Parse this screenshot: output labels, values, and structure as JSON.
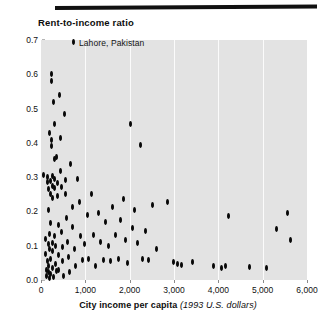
{
  "chart_data": {
    "type": "scatter",
    "title": "Rent-to-income ratio",
    "xlabel_bold": "City income per capita",
    "xlabel_italic": "(1993 U.S. dollars)",
    "ylabel": "Rent-to-income ratio",
    "xlim": [
      0,
      6000
    ],
    "ylim": [
      0.0,
      0.7
    ],
    "x_ticks": [
      0,
      1000,
      2000,
      3000,
      4000,
      5000,
      6000
    ],
    "x_tick_labels": [
      "0",
      "1,000",
      "2,000",
      "3,000",
      "4,000",
      "5,000",
      "6,000"
    ],
    "y_ticks": [
      0.0,
      0.1,
      0.2,
      0.3,
      0.4,
      0.5,
      0.6,
      0.7
    ],
    "y_tick_labels": [
      "0.0",
      "0.1",
      "0.2",
      "0.3",
      "0.4",
      "0.5",
      "0.6",
      "0.7"
    ],
    "grid": "vertical",
    "legend": "none",
    "plot_background": "#e3e3e3",
    "marker_color": "#080808",
    "annotations": [
      {
        "text": "Lahore, Pakistan",
        "x": 360,
        "y": 0.695,
        "marker": true
      }
    ],
    "points": [
      {
        "x": 60,
        "y": 0.305
      },
      {
        "x": 95,
        "y": 0.12
      },
      {
        "x": 110,
        "y": 0.075
      },
      {
        "x": 120,
        "y": 0.03
      },
      {
        "x": 130,
        "y": 0.012
      },
      {
        "x": 145,
        "y": 0.055
      },
      {
        "x": 150,
        "y": 0.3
      },
      {
        "x": 155,
        "y": 0.285
      },
      {
        "x": 160,
        "y": 0.205
      },
      {
        "x": 165,
        "y": 0.105
      },
      {
        "x": 170,
        "y": 0.022
      },
      {
        "x": 175,
        "y": 0.04
      },
      {
        "x": 180,
        "y": 0.265
      },
      {
        "x": 185,
        "y": 0.135
      },
      {
        "x": 190,
        "y": 0.09
      },
      {
        "x": 195,
        "y": 0.005
      },
      {
        "x": 200,
        "y": 0.43
      },
      {
        "x": 205,
        "y": 0.29
      },
      {
        "x": 210,
        "y": 0.25
      },
      {
        "x": 215,
        "y": 0.165
      },
      {
        "x": 220,
        "y": 0.06
      },
      {
        "x": 225,
        "y": 0.018
      },
      {
        "x": 230,
        "y": 0.6
      },
      {
        "x": 235,
        "y": 0.58
      },
      {
        "x": 240,
        "y": 0.408
      },
      {
        "x": 245,
        "y": 0.39
      },
      {
        "x": 250,
        "y": 0.302
      },
      {
        "x": 255,
        "y": 0.275
      },
      {
        "x": 258,
        "y": 0.24
      },
      {
        "x": 262,
        "y": 0.108
      },
      {
        "x": 266,
        "y": 0.085
      },
      {
        "x": 270,
        "y": 0.035
      },
      {
        "x": 275,
        "y": 0.01
      },
      {
        "x": 290,
        "y": 0.52
      },
      {
        "x": 295,
        "y": 0.455
      },
      {
        "x": 300,
        "y": 0.352
      },
      {
        "x": 305,
        "y": 0.296
      },
      {
        "x": 310,
        "y": 0.268
      },
      {
        "x": 315,
        "y": 0.128
      },
      {
        "x": 320,
        "y": 0.098
      },
      {
        "x": 330,
        "y": 0.048
      },
      {
        "x": 340,
        "y": 0.026
      },
      {
        "x": 355,
        "y": 0.358
      },
      {
        "x": 365,
        "y": 0.282
      },
      {
        "x": 375,
        "y": 0.245
      },
      {
        "x": 385,
        "y": 0.16
      },
      {
        "x": 395,
        "y": 0.072
      },
      {
        "x": 405,
        "y": 0.03
      },
      {
        "x": 420,
        "y": 0.54
      },
      {
        "x": 430,
        "y": 0.415
      },
      {
        "x": 445,
        "y": 0.318
      },
      {
        "x": 455,
        "y": 0.272
      },
      {
        "x": 470,
        "y": 0.14
      },
      {
        "x": 480,
        "y": 0.095
      },
      {
        "x": 495,
        "y": 0.055
      },
      {
        "x": 510,
        "y": 0.012
      },
      {
        "x": 530,
        "y": 0.485
      },
      {
        "x": 545,
        "y": 0.292
      },
      {
        "x": 560,
        "y": 0.252
      },
      {
        "x": 580,
        "y": 0.18
      },
      {
        "x": 600,
        "y": 0.112
      },
      {
        "x": 620,
        "y": 0.068
      },
      {
        "x": 640,
        "y": 0.022
      },
      {
        "x": 670,
        "y": 0.338
      },
      {
        "x": 700,
        "y": 0.212
      },
      {
        "x": 720,
        "y": 0.155
      },
      {
        "x": 745,
        "y": 0.09
      },
      {
        "x": 780,
        "y": 0.04
      },
      {
        "x": 820,
        "y": 0.295
      },
      {
        "x": 860,
        "y": 0.228
      },
      {
        "x": 900,
        "y": 0.128
      },
      {
        "x": 940,
        "y": 0.058
      },
      {
        "x": 990,
        "y": 0.105
      },
      {
        "x": 1040,
        "y": 0.19
      },
      {
        "x": 1080,
        "y": 0.062
      },
      {
        "x": 1130,
        "y": 0.25
      },
      {
        "x": 1180,
        "y": 0.132
      },
      {
        "x": 1230,
        "y": 0.042
      },
      {
        "x": 1290,
        "y": 0.196
      },
      {
        "x": 1340,
        "y": 0.112
      },
      {
        "x": 1400,
        "y": 0.058
      },
      {
        "x": 1460,
        "y": 0.168
      },
      {
        "x": 1520,
        "y": 0.098
      },
      {
        "x": 1570,
        "y": 0.055
      },
      {
        "x": 1620,
        "y": 0.212
      },
      {
        "x": 1680,
        "y": 0.13
      },
      {
        "x": 1740,
        "y": 0.062
      },
      {
        "x": 1800,
        "y": 0.175
      },
      {
        "x": 1860,
        "y": 0.235
      },
      {
        "x": 1910,
        "y": 0.118
      },
      {
        "x": 1960,
        "y": 0.05
      },
      {
        "x": 2010,
        "y": 0.455
      },
      {
        "x": 2060,
        "y": 0.152
      },
      {
        "x": 2120,
        "y": 0.205
      },
      {
        "x": 2180,
        "y": 0.108
      },
      {
        "x": 2240,
        "y": 0.395
      },
      {
        "x": 2300,
        "y": 0.062
      },
      {
        "x": 2360,
        "y": 0.142
      },
      {
        "x": 2420,
        "y": 0.058
      },
      {
        "x": 2520,
        "y": 0.218
      },
      {
        "x": 2600,
        "y": 0.09
      },
      {
        "x": 2860,
        "y": 0.228
      },
      {
        "x": 2980,
        "y": 0.052
      },
      {
        "x": 3080,
        "y": 0.048
      },
      {
        "x": 3160,
        "y": 0.045
      },
      {
        "x": 3420,
        "y": 0.052
      },
      {
        "x": 3880,
        "y": 0.04
      },
      {
        "x": 4080,
        "y": 0.035
      },
      {
        "x": 4160,
        "y": 0.042
      },
      {
        "x": 4240,
        "y": 0.188
      },
      {
        "x": 4700,
        "y": 0.038
      },
      {
        "x": 5080,
        "y": 0.035
      },
      {
        "x": 5320,
        "y": 0.148
      },
      {
        "x": 5560,
        "y": 0.195
      },
      {
        "x": 5620,
        "y": 0.118
      }
    ]
  }
}
